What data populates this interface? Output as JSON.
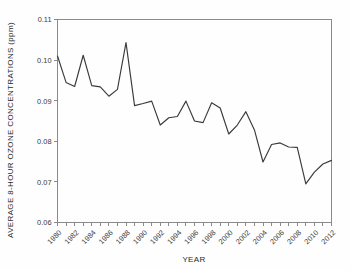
{
  "chart_data": {
    "type": "line",
    "title": "",
    "xlabel": "YEAR",
    "ylabel": "AVERAGE 8-HOUR OZONE CONCENTRATIONS (ppm)",
    "ylim": [
      0.06,
      0.11
    ],
    "xlim": [
      1980,
      2012
    ],
    "grid": false,
    "legend": null,
    "y_ticks": [
      "0.06",
      "0.07",
      "0.08",
      "0.09",
      "0.10",
      "0.11"
    ],
    "y_tick_values": [
      0.06,
      0.07,
      0.08,
      0.09,
      0.1,
      0.11
    ],
    "x_tick_labels": [
      "1980",
      "1982",
      "1984",
      "1986",
      "1988",
      "1990",
      "1992",
      "1994",
      "1996",
      "1998",
      "2000",
      "2002",
      "2004",
      "2006",
      "2008",
      "2010",
      "2012"
    ],
    "x_tick_values": [
      1980,
      1982,
      1984,
      1986,
      1988,
      1990,
      1992,
      1994,
      1996,
      1998,
      2000,
      2002,
      2004,
      2006,
      2008,
      2010,
      2012
    ],
    "x_minor_every": 1,
    "line_color": "#3a3a3a",
    "x": [
      1980,
      1981,
      1982,
      1983,
      1984,
      1985,
      1986,
      1987,
      1988,
      1989,
      1990,
      1991,
      1992,
      1993,
      1994,
      1995,
      1996,
      1997,
      1998,
      1999,
      2000,
      2001,
      2002,
      2003,
      2004,
      2005,
      2006,
      2007,
      2008,
      2009,
      2010,
      2011,
      2012
    ],
    "values": [
      0.101,
      0.0945,
      0.0935,
      0.1012,
      0.0937,
      0.0934,
      0.0911,
      0.0928,
      0.1043,
      0.0888,
      0.0893,
      0.0899,
      0.084,
      0.0858,
      0.0861,
      0.0899,
      0.085,
      0.0846,
      0.0895,
      0.0882,
      0.0818,
      0.084,
      0.0873,
      0.0828,
      0.0749,
      0.0792,
      0.0796,
      0.0786,
      0.0785,
      0.0695,
      0.0724,
      0.0744,
      0.0753
    ]
  },
  "axes": {
    "x_title": "YEAR",
    "y_title": "AVERAGE 8-HOUR OZONE CONCENTRATIONS (ppm)"
  }
}
